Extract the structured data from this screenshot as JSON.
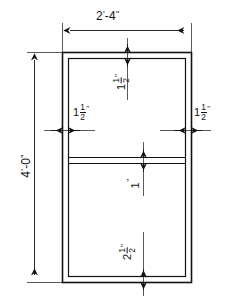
{
  "drawing": {
    "type": "architectural-dimension-drawing",
    "description": "Elevation of a two-panel rectangular frame with dimension callouts",
    "line_color": "#121212",
    "background_color": "#ffffff",
    "overall": {
      "width_label": {
        "value": "2'-4\"",
        "feet": "2",
        "inches": "4",
        "orientation": "horizontal",
        "position": "top"
      },
      "height_label": {
        "value": "4'-0\"",
        "feet": "4",
        "inches": "0",
        "orientation": "vertical",
        "position": "left"
      }
    },
    "details": [
      {
        "name": "top-rail-thickness",
        "whole": "1",
        "numerator": "1",
        "denominator": "2",
        "unit": "\"",
        "full": "1 1/2\"",
        "orientation": "vertical",
        "position": "top-center"
      },
      {
        "name": "left-stile-thickness",
        "whole": "1",
        "numerator": "1",
        "denominator": "2",
        "unit": "\"",
        "full": "1 1/2\"",
        "orientation": "horizontal",
        "position": "left-center"
      },
      {
        "name": "right-stile-thickness",
        "whole": "1",
        "numerator": "1",
        "denominator": "2",
        "unit": "\"",
        "full": "1 1/2\"",
        "orientation": "horizontal",
        "position": "right-center"
      },
      {
        "name": "middle-rail-thickness",
        "whole": "1",
        "numerator": "",
        "denominator": "",
        "unit": "\"",
        "full": "1\"",
        "orientation": "vertical",
        "position": "middle-center"
      },
      {
        "name": "bottom-rail-thickness",
        "whole": "2",
        "numerator": "1",
        "denominator": "2",
        "unit": "\"",
        "full": "2 1/2\"",
        "orientation": "vertical",
        "position": "bottom-center"
      }
    ]
  }
}
